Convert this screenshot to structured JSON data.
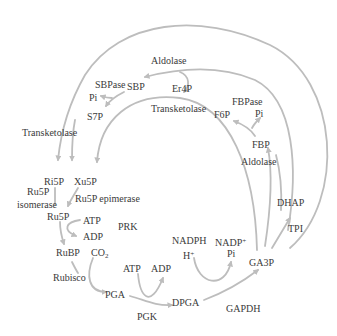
{
  "diagram": {
    "colors": {
      "arrow": "#bdbdbd",
      "text": "#3a3a3a",
      "background": "#ffffff"
    },
    "metabolites": {
      "sbp": "SBP",
      "pi_sbp": "Pi",
      "s7p": "S7P",
      "er4p": "Er4P",
      "f6p": "F6P",
      "pi_fbp": "Pi",
      "fbp": "FBP",
      "dhap": "DHAP",
      "ga3p": "GA3P",
      "ri5p": "Ri5P",
      "xu5p": "Xu5P",
      "ru5p": "Ru5P",
      "atp_prk": "ATP",
      "adp_prk": "ADP",
      "rubp": "RuBP",
      "co2_main": "CO",
      "co2_sub": "2",
      "pga": "PGA",
      "atp_pgk": "ATP",
      "adp_pgk": "ADP",
      "dpga": "DPGA",
      "nadph": "NADPH",
      "h_plus_main": "H",
      "h_plus_sup": "+",
      "nadp_main": "NADP",
      "nadp_sup": "+",
      "pi_gapdh": "Pi"
    },
    "enzymes": {
      "aldolase_top": "Aldolase",
      "sbpase": "SBPase",
      "transketolase_left": "Transketolase",
      "transketolase_mid": "Transketolase",
      "fbpase": "FBPase",
      "aldolase_right": "Aldolase",
      "tpi": "TPI",
      "ru5p_isomerase_1": "Ru5P",
      "ru5p_isomerase_2": "isomerase",
      "ru5p_epimerase": "Ru5P epimerase",
      "prk": "PRK",
      "rubisco": "Rubisco",
      "pgk": "PGK",
      "gapdh": "GAPDH"
    }
  }
}
